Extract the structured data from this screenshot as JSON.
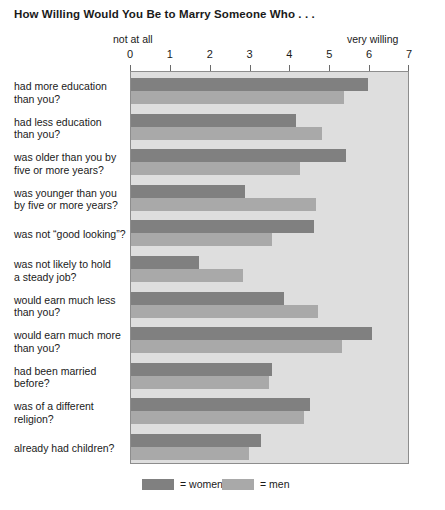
{
  "chart_data": {
    "type": "bar",
    "orientation": "horizontal",
    "title": "How Willing Would You Be to Marry Someone Who . . .",
    "xlabel": "",
    "ylabel": "",
    "xlim": [
      0,
      7
    ],
    "xticks": [
      0,
      1,
      2,
      3,
      4,
      5,
      6,
      7
    ],
    "xtick_labels": [
      "0",
      "1",
      "2",
      "3",
      "4",
      "5",
      "6",
      "7"
    ],
    "scale_anchor_low": "not at all",
    "scale_anchor_high": "very willing",
    "grid": false,
    "legend_position": "bottom-left",
    "categories": [
      "had more education\nthan you?",
      "had less education\nthan you?",
      "was older than you by\nfive or more years?",
      "was younger than you\nby five or more years?",
      "was not “good looking”?",
      "was not likely to hold\na steady job?",
      "would earn much less\nthan you?",
      "would earn much more\nthan you?",
      "had been married\nbefore?",
      "was of a different\nreligion?",
      "already had children?"
    ],
    "series": [
      {
        "name": "women",
        "color": "#808080",
        "values": [
          5.95,
          4.15,
          5.4,
          2.85,
          4.6,
          1.7,
          3.85,
          6.05,
          3.55,
          4.5,
          3.25
        ]
      },
      {
        "name": "men",
        "color": "#a9a9a9",
        "values": [
          5.35,
          4.8,
          4.25,
          4.65,
          3.55,
          2.8,
          4.7,
          5.3,
          3.45,
          4.35,
          2.95
        ]
      }
    ]
  },
  "legend": {
    "women_label": "= women",
    "men_label": "= men"
  }
}
